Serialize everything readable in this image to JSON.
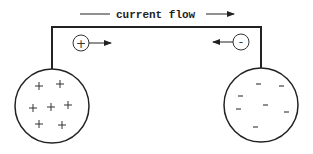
{
  "diagram": {
    "title": "current flow",
    "colors": {
      "stroke": "#222222",
      "background": "#ffffff"
    },
    "left_sphere": {
      "charge": "positive",
      "symbol": "+",
      "count": 7
    },
    "right_sphere": {
      "charge": "negative",
      "symbol": "-",
      "count": 7
    },
    "left_carrier": {
      "symbol": "+",
      "direction": "right"
    },
    "right_carrier": {
      "symbol": "-",
      "direction": "left"
    }
  }
}
